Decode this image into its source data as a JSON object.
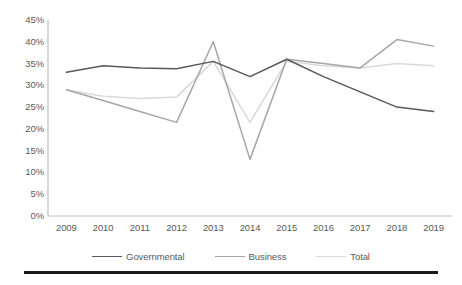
{
  "chart_data": {
    "type": "line",
    "title": "",
    "subtitle": "",
    "xlabel": "",
    "ylabel": "",
    "categories": [
      "2009",
      "2010",
      "2011",
      "2012",
      "2013",
      "2014",
      "2015",
      "2016",
      "2017",
      "2018",
      "2019"
    ],
    "x": [
      2009,
      2010,
      2011,
      2012,
      2013,
      2014,
      2015,
      2016,
      2017,
      2018,
      2019
    ],
    "series": [
      {
        "name": "Governmental",
        "color": "#595959",
        "values": [
          33,
          34.5,
          34,
          33.8,
          35.5,
          32,
          36,
          32,
          28.5,
          25,
          24
        ]
      },
      {
        "name": "Business",
        "color": "#a6a6a6",
        "values": [
          29,
          26.5,
          24,
          21.5,
          40,
          13,
          36,
          35,
          34,
          40.5,
          39
        ]
      },
      {
        "name": "Total",
        "color": "#d9d9d9",
        "values": [
          29,
          27.5,
          27,
          27.3,
          35.5,
          21.5,
          35.5,
          34.5,
          34,
          35,
          34.5
        ]
      }
    ],
    "ylim": [
      0,
      45
    ],
    "ytick_values": [
      0,
      5,
      10,
      15,
      20,
      25,
      30,
      35,
      40,
      45
    ],
    "ytick_labels": [
      "0%",
      "5%",
      "10%",
      "15%",
      "20%",
      "25%",
      "30%",
      "35%",
      "40%",
      "45%"
    ],
    "grid": false,
    "legend_position": "bottom",
    "legend_entries": [
      "Governmental",
      "Business",
      "Total"
    ],
    "annotations": []
  },
  "axis": {
    "y_axis_color": "#bfbfbf",
    "x_axis_color": "#bfbfbf"
  },
  "footer": {
    "rule_color": "#1a1a1a"
  }
}
